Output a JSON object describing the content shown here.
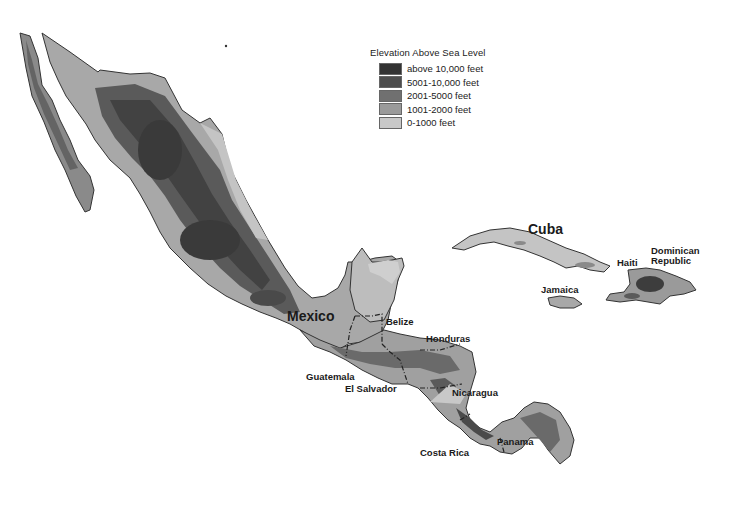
{
  "legend": {
    "title": "Elevation Above Sea Level",
    "items": [
      {
        "label": "above 10,000 feet",
        "color": "#333333"
      },
      {
        "label": "5001-10,000 feet",
        "color": "#4d4d4d"
      },
      {
        "label": "2001-5000 feet",
        "color": "#707070"
      },
      {
        "label": "1001-2000 feet",
        "color": "#9a9a9a"
      },
      {
        "label": "0-1000 feet",
        "color": "#c8c8c8"
      }
    ]
  },
  "labels": {
    "mexico": "Mexico",
    "cuba": "Cuba",
    "haiti": "Haiti",
    "dominican_republic_1": "Dominican",
    "dominican_republic_2": "Republic",
    "jamaica": "Jamaica",
    "belize": "Belize",
    "honduras": "Honduras",
    "guatemala": "Guatemala",
    "el_salvador": "El Salvador",
    "nicaragua": "Nicaragua",
    "costa_rica": "Costa Rica",
    "panama": "Panama"
  }
}
